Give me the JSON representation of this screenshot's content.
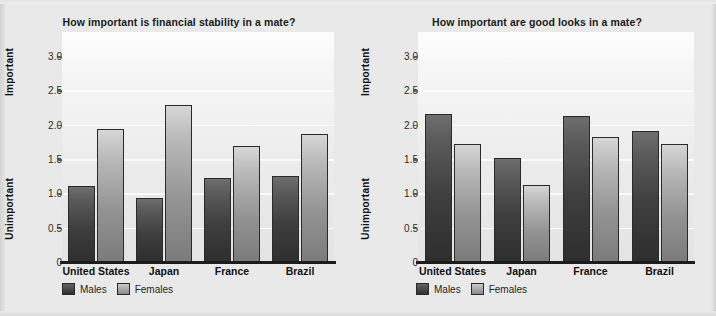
{
  "chart_data": [
    {
      "type": "bar",
      "title": "How important is financial stability in a mate?",
      "xlabel": "",
      "ylabel": "",
      "categories": [
        "United States",
        "Japan",
        "France",
        "Brazil"
      ],
      "series": [
        {
          "name": "Males",
          "values": [
            1.1,
            0.93,
            1.22,
            1.25
          ]
        },
        {
          "name": "Females",
          "values": [
            1.94,
            2.28,
            1.69,
            1.87
          ]
        }
      ],
      "yticks": [
        "0",
        "0.5",
        "1.0",
        "1.5",
        "2.0",
        "2.5",
        "3.0"
      ],
      "ytick_values": [
        0,
        0.5,
        1.0,
        1.5,
        2.0,
        2.5,
        3.0
      ],
      "ylim": [
        0,
        3.35
      ],
      "y_axis_low_label": "Unimportant",
      "y_axis_high_label": "Important",
      "grid": true,
      "legend_position": "bottom-left",
      "legend": [
        "Males",
        "Females"
      ]
    },
    {
      "type": "bar",
      "title": "How important are good looks in a mate?",
      "xlabel": "",
      "ylabel": "",
      "categories": [
        "United States",
        "Japan",
        "France",
        "Brazil"
      ],
      "series": [
        {
          "name": "Males",
          "values": [
            2.15,
            1.51,
            2.12,
            1.91
          ]
        },
        {
          "name": "Females",
          "values": [
            1.72,
            1.12,
            1.82,
            1.72
          ]
        }
      ],
      "yticks": [
        "0",
        "0.5",
        "1.0",
        "1.5",
        "2.0",
        "2.5",
        "3.0"
      ],
      "ytick_values": [
        0,
        0.5,
        1.0,
        1.5,
        2.0,
        2.5,
        3.0
      ],
      "ylim": [
        0,
        3.35
      ],
      "y_axis_low_label": "Unimportant",
      "y_axis_high_label": "Important",
      "grid": true,
      "legend_position": "bottom-left",
      "legend": [
        "Males",
        "Females"
      ]
    }
  ],
  "colors": {
    "males": "#3f3f3f",
    "females": "#949494",
    "background": "#e9e9e9",
    "plot_background": "#f2f2f2",
    "gridline": "#fbfbfb",
    "axis": "#1c1c1c",
    "text": "#111111"
  }
}
